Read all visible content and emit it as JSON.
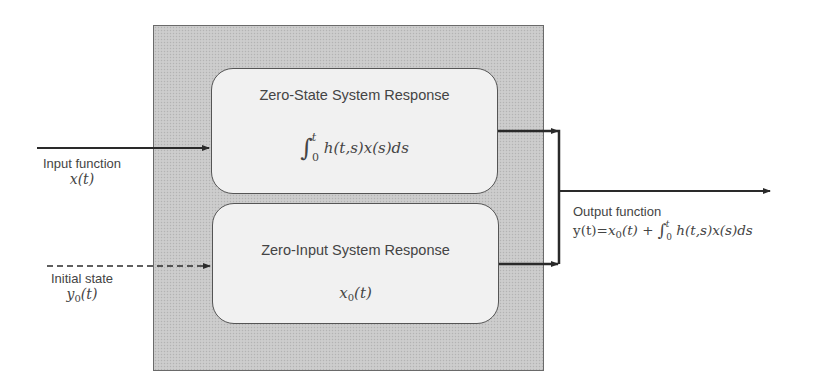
{
  "diagram": {
    "type": "block-diagram",
    "system_box": {
      "fill": "#c9c9c9",
      "border": "#6a6a6a"
    },
    "blocks": [
      {
        "id": "zero-state",
        "title": "Zero-State System Response",
        "formula": {
          "integral_symbol": "∫",
          "upper_limit": "t",
          "lower_limit": "0",
          "integrand": "h(t,s)x(s)ds"
        }
      },
      {
        "id": "zero-input",
        "title": "Zero-Input System Response",
        "formula": {
          "base": "x",
          "subscript": "0",
          "argument": "(t)"
        }
      }
    ],
    "inputs": [
      {
        "id": "input-function",
        "label": "Input function",
        "math": "x(t)",
        "line_style": "solid"
      },
      {
        "id": "initial-state",
        "label": "Initial state",
        "math_base": "y",
        "math_subscript": "0",
        "math_argument": "(t)",
        "line_style": "dashed"
      }
    ],
    "output": {
      "label": "Output function",
      "lhs": "y(t)=",
      "x0_base": "x",
      "x0_sub": "0",
      "x0_arg": "(t) + ",
      "integral_symbol": "∫",
      "upper_limit": "t",
      "lower_limit": "0",
      "integrand": "h(t,s)x(s)ds"
    },
    "colors": {
      "line": "#2a2a2a",
      "block_fill": "#f1f1f1",
      "block_border": "#555555",
      "text": "#444444"
    }
  }
}
